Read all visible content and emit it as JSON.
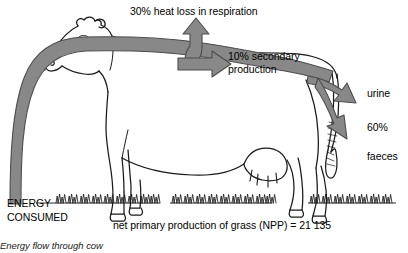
{
  "diagram": {
    "title": "Energy flow through cow",
    "caption": "Energy flow through cow",
    "subject_icon": "cow-illustration",
    "colors": {
      "flow_fill": "#888888",
      "flow_stroke": "#4d4d4d",
      "outline": "#1a1a1a",
      "background": "#ffffff",
      "text": "#000000"
    },
    "labels": {
      "heat_loss": "30% heat loss in respiration",
      "secondary_production": "10% secondary production",
      "urine": "urine",
      "percent_faeces": "60%",
      "faeces": "faeces",
      "energy_consumed": "ENERGY CONSUMED",
      "npp": "net primary production of grass (NPP) = 21 135"
    },
    "flows": [
      {
        "name": "energy-consumed-input",
        "label": "ENERGY CONSUMED",
        "direction": "up-then-right",
        "percent": null,
        "source": "grass",
        "target": "cow"
      },
      {
        "name": "heat-loss-respiration",
        "label": "30% heat loss in respiration",
        "direction": "up",
        "percent": 30,
        "source": "cow",
        "target": "atmosphere"
      },
      {
        "name": "secondary-production",
        "label": "10% secondary production",
        "direction": "right",
        "percent": 10,
        "source": "cow",
        "target": "biomass"
      },
      {
        "name": "urine-output",
        "label": "urine",
        "direction": "down-right",
        "percent": null,
        "source": "cow",
        "target": "urine"
      },
      {
        "name": "faeces-output",
        "label": "60% faeces",
        "direction": "down-right",
        "percent": 60,
        "source": "cow",
        "target": "faeces"
      }
    ],
    "values": {
      "npp_amount": "21 135",
      "heat_loss_percent": "30%",
      "secondary_percent": "10%",
      "faeces_percent": "60%"
    }
  }
}
